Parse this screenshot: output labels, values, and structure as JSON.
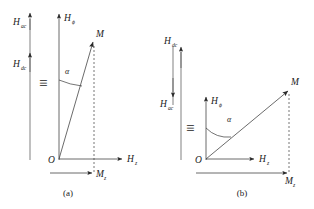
{
  "figure": {
    "type": "vector-diagram",
    "background_color": "#ffffff",
    "line_color": "#3a3a3a",
    "text_color": "#1a1a1a"
  },
  "panels": [
    {
      "id": "a",
      "caption": "(a)",
      "equiv_symbol": "≡",
      "field_stack": {
        "upper": {
          "base": "H",
          "subscript": "ac",
          "arrow_direction": "up"
        },
        "lower": {
          "base": "H",
          "subscript": "dc",
          "arrow_direction": "up"
        }
      },
      "vertical_axis": {
        "base": "H",
        "subscript": "ϕ",
        "arrow_direction": "up"
      },
      "horizontal_axis": {
        "base": "H",
        "subscript": "z",
        "arrow_direction": "right"
      },
      "origin_label": "O",
      "magnetization": {
        "label": "M",
        "angle_from_vertical_deg": 25
      },
      "angle_label": "α",
      "projection": {
        "base": "M",
        "subscript": "z",
        "arrow_direction": "right",
        "length": "short"
      }
    },
    {
      "id": "b",
      "caption": "(b)",
      "equiv_symbol": "≡",
      "field_stack": {
        "upper": {
          "base": "H",
          "subscript": "dc",
          "arrow_direction": "up"
        },
        "lower": {
          "base": "H",
          "subscript": "ac",
          "arrow_direction": "down"
        }
      },
      "vertical_axis": {
        "base": "H",
        "subscript": "ϕ",
        "arrow_direction": "up"
      },
      "horizontal_axis": {
        "base": "H",
        "subscript": "z",
        "arrow_direction": "right"
      },
      "origin_label": "O",
      "magnetization": {
        "label": "M",
        "angle_from_vertical_deg": 52
      },
      "angle_label": "α",
      "projection": {
        "base": "M",
        "subscript": "z",
        "arrow_direction": "right",
        "length": "long"
      }
    }
  ]
}
